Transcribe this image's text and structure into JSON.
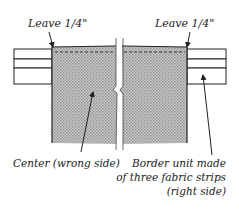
{
  "labels": {
    "leave_left": "Leave 1/4\"",
    "leave_right": "Leave 1/4\"",
    "center": "Center (wrong side)",
    "border_line1": "Border unit made",
    "border_line2": "of three fabric strips",
    "border_line3": "(right side)"
  },
  "colors": {
    "ink": "#222222",
    "shade": "#b5b5b5",
    "background": "#ffffff"
  }
}
